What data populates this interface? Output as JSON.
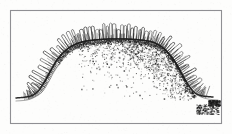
{
  "figure": {
    "domain": "natural-image",
    "kind": "scanned-engraving",
    "title": "Dome-shaped ciliated organism cross-section",
    "description": "Monochrome scanned line engraving of a broad plateau-shaped body with a fringe of fine radiating hairs along its entire border, a row of arch loops across the upper surface, a heavy dark contour line, and a stippled granular field filling the right interior.",
    "background_color": "#fdfdfc",
    "ink_color": "#1d1d1d",
    "frame": {
      "name": "plate-border",
      "x": 10,
      "y": 10,
      "width": 211,
      "height": 113,
      "stroke_color": "#8f8f93",
      "stroke_width": 1.1
    },
    "paper_tone": "#fbfbf9"
  },
  "chart_data": {
    "type": "line",
    "title": "Dome-shaped ciliated organism cross-section",
    "xlabel": "",
    "ylabel": "",
    "xlim": [
      10,
      221
    ],
    "ylim": [
      10,
      123
    ],
    "grid": false,
    "legend": "none",
    "series": [
      {
        "name": "outer-contour",
        "comment": "Heavy dark outline: flat baseline left, rising left shoulder, flat plateau, descending right shoulder, flat baseline right",
        "x": [
          16,
          26,
          33,
          39,
          45,
          51,
          57,
          64,
          72,
          82,
          95,
          110,
          125,
          140,
          152,
          162,
          170,
          177,
          183,
          189,
          195,
          203,
          213
        ],
        "y": [
          98,
          97,
          95,
          90,
          81,
          70,
          60,
          52,
          46,
          42,
          40,
          39,
          39,
          40,
          42,
          47,
          55,
          65,
          76,
          86,
          93,
          96,
          97
        ]
      },
      {
        "name": "inner-contour",
        "comment": "Lighter secondary curve offset outward from the heavy contour, forming the body wall band",
        "x": [
          16,
          27,
          35,
          42,
          48,
          54,
          61,
          69,
          79,
          92,
          108,
          124,
          140,
          153,
          163,
          172,
          179,
          186,
          192,
          199,
          208,
          218
        ],
        "y": [
          101,
          100,
          97,
          92,
          83,
          72,
          62,
          53,
          47,
          43,
          41,
          41,
          42,
          45,
          50,
          58,
          69,
          80,
          90,
          96,
          99,
          100
        ]
      }
    ],
    "fringe": {
      "name": "cilia-fringe",
      "comment": "Fine hair strokes radiating outward perpendicular to the contour around the whole dome",
      "count": 150,
      "length_range": [
        5,
        13
      ],
      "stroke_color": "#262626"
    },
    "arch_row": {
      "name": "arch-loop-row",
      "comment": "Row of rounded arch loops resembling linked n-shapes along the top plateau and shoulders",
      "count": 46,
      "height_range": [
        8,
        16
      ],
      "x_start": 36,
      "x_end": 190
    },
    "stipple_field": {
      "name": "stipple-texture",
      "comment": "Scattered granular dots densest just beneath the plateau contour and along the right shoulder, fading downward and to the left",
      "dot_count": 1500,
      "densest_region": [
        118,
        42,
        190,
        95
      ],
      "fade_direction": "downward-and-leftward"
    },
    "smudges": {
      "name": "scan-artifact-smudges",
      "comment": "Dark scanning blotches near the lower right corner of the plate",
      "regions": [
        [
          196,
          104,
          22,
          10
        ],
        [
          208,
          100,
          12,
          6
        ]
      ]
    }
  }
}
